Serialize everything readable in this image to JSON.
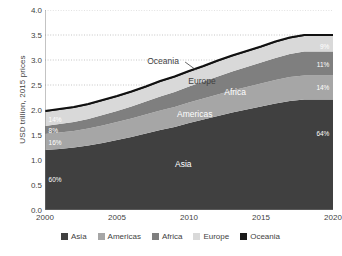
{
  "chart_data": {
    "type": "area",
    "title": "",
    "subtitle": "",
    "xlabel": "",
    "ylabel": "USD trillion, 2015 prices",
    "xlim": [
      2000,
      2020
    ],
    "ylim": [
      0.0,
      4.0
    ],
    "grid": true,
    "grid_style": "dotted-horizontal",
    "legend_position": "bottom-center",
    "stacked": true,
    "stack_order_bottom_to_top": [
      "Asia",
      "Americas",
      "Africa",
      "Europe",
      "Oceania"
    ],
    "x": [
      2000,
      2001,
      2002,
      2003,
      2004,
      2005,
      2006,
      2007,
      2008,
      2009,
      2010,
      2011,
      2012,
      2013,
      2014,
      2015,
      2016,
      2017,
      2018,
      2019,
      2020
    ],
    "y_ticks": [
      "0.0",
      "0.5",
      "1.0",
      "1.5",
      "2.0",
      "2.5",
      "3.0",
      "3.5",
      "4.0"
    ],
    "y_tick_values": [
      0.0,
      0.5,
      1.0,
      1.5,
      2.0,
      2.5,
      3.0,
      3.5,
      4.0
    ],
    "x_ticks": [
      "2000",
      "2005",
      "2010",
      "2015",
      "2020"
    ],
    "x_tick_values": [
      2000,
      2005,
      2010,
      2015,
      2020
    ],
    "x_minor_tick_interval": 1,
    "series": [
      {
        "name": "Asia",
        "color": "#404040",
        "values": [
          1.2,
          1.22,
          1.25,
          1.29,
          1.34,
          1.4,
          1.46,
          1.53,
          1.6,
          1.66,
          1.74,
          1.81,
          1.88,
          1.95,
          2.01,
          2.07,
          2.13,
          2.18,
          2.21,
          2.21,
          2.21
        ]
      },
      {
        "name": "Americas",
        "color": "#a6a6a6",
        "values": [
          0.32,
          0.33,
          0.33,
          0.34,
          0.35,
          0.36,
          0.37,
          0.38,
          0.39,
          0.4,
          0.41,
          0.42,
          0.43,
          0.44,
          0.45,
          0.46,
          0.47,
          0.48,
          0.48,
          0.48,
          0.48
        ]
      },
      {
        "name": "Africa",
        "color": "#7f7f7f",
        "values": [
          0.16,
          0.17,
          0.18,
          0.19,
          0.21,
          0.22,
          0.24,
          0.26,
          0.28,
          0.3,
          0.32,
          0.34,
          0.36,
          0.38,
          0.4,
          0.42,
          0.44,
          0.46,
          0.48,
          0.48,
          0.48
        ]
      },
      {
        "name": "Europe",
        "color": "#d9d9d9",
        "values": [
          0.28,
          0.28,
          0.28,
          0.28,
          0.28,
          0.28,
          0.28,
          0.28,
          0.29,
          0.29,
          0.29,
          0.29,
          0.3,
          0.3,
          0.3,
          0.3,
          0.31,
          0.31,
          0.31,
          0.31,
          0.31
        ]
      },
      {
        "name": "Oceania",
        "color": "#1a1a1a",
        "values": [
          0.02,
          0.02,
          0.02,
          0.02,
          0.02,
          0.02,
          0.02,
          0.02,
          0.02,
          0.02,
          0.02,
          0.02,
          0.02,
          0.02,
          0.02,
          0.02,
          0.02,
          0.02,
          0.02,
          0.02,
          0.02
        ]
      }
    ],
    "totals": [
      1.98,
      2.02,
      2.06,
      2.12,
      2.2,
      2.28,
      2.37,
      2.47,
      2.58,
      2.67,
      2.78,
      2.88,
      2.99,
      3.09,
      3.18,
      3.27,
      3.37,
      3.45,
      3.5,
      3.5,
      3.5
    ],
    "annotations": [
      {
        "text": "Oceania",
        "x": 2008.2,
        "y": 2.98,
        "color": "#3f3f3f",
        "leader": true
      },
      {
        "text": "Europe",
        "x": 2010.9,
        "y": 2.58,
        "color": "#3f3f3f",
        "leader": false
      },
      {
        "text": "Africa",
        "x": 2013.2,
        "y": 2.36,
        "color": "#ffffff",
        "leader": false
      },
      {
        "text": "Americas",
        "x": 2010.4,
        "y": 1.92,
        "color": "#ffffff",
        "leader": false
      },
      {
        "text": "Asia",
        "x": 2009.6,
        "y": 0.92,
        "color": "#ffffff",
        "leader": false
      }
    ],
    "share_labels_start": [
      {
        "series": "Europe",
        "text": "14%",
        "x": 2000.25,
        "y": 1.83
      },
      {
        "series": "Africa",
        "text": "8%",
        "x": 2000.25,
        "y": 1.6
      },
      {
        "series": "Americas",
        "text": "16%",
        "x": 2000.25,
        "y": 1.37
      },
      {
        "series": "Asia",
        "text": "60%",
        "x": 2000.25,
        "y": 0.62
      }
    ],
    "share_labels_end": [
      {
        "series": "Europe",
        "text": "9%",
        "x": 2019.75,
        "y": 3.28
      },
      {
        "series": "Africa",
        "text": "11%",
        "x": 2019.75,
        "y": 2.93
      },
      {
        "series": "Americas",
        "text": "14%",
        "x": 2019.75,
        "y": 2.47
      },
      {
        "series": "Asia",
        "text": "64%",
        "x": 2019.75,
        "y": 1.55
      }
    ]
  },
  "legend": {
    "items": [
      {
        "label": "Asia",
        "color": "#404040"
      },
      {
        "label": "Americas",
        "color": "#a6a6a6"
      },
      {
        "label": "Africa",
        "color": "#7f7f7f"
      },
      {
        "label": "Europe",
        "color": "#d9d9d9"
      },
      {
        "label": "Oceania",
        "color": "#1a1a1a"
      }
    ]
  },
  "axes": {
    "y_title": "USD trillion, 2015 prices"
  }
}
